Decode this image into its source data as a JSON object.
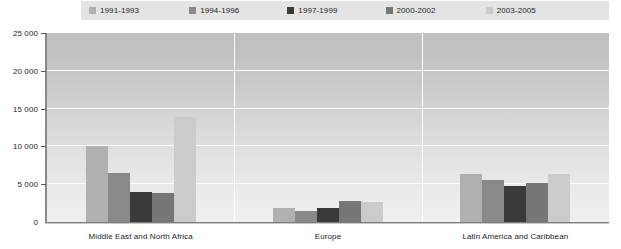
{
  "chart_data": {
    "type": "bar",
    "title": "",
    "subtitle": "",
    "xlabel": "",
    "ylabel": "",
    "categories": [
      "Middle East and North Africa",
      "Europe",
      "Latin America and Caribbean"
    ],
    "series": [
      {
        "name": "1991-1993",
        "color": "#b0b0b0",
        "values": [
          10100,
          1900,
          6400
        ]
      },
      {
        "name": "1994-1996",
        "color": "#898989",
        "values": [
          6500,
          1500,
          5500
        ]
      },
      {
        "name": "1997-1999",
        "color": "#3a3a3a",
        "values": [
          4000,
          1900,
          4800
        ]
      },
      {
        "name": "2000-2002",
        "color": "#767676",
        "values": [
          3800,
          2800,
          5200
        ]
      },
      {
        "name": "2003-2005",
        "color": "#cbcbcb",
        "values": [
          13900,
          2600,
          6300
        ]
      }
    ],
    "ylim": [
      0,
      25000
    ],
    "yticks": [
      0,
      5000,
      10000,
      15000,
      20000,
      25000
    ],
    "ytick_labels": [
      "0",
      "5 000",
      "10 000",
      "15 000",
      "20 000",
      "25 000"
    ],
    "grid": true,
    "legend_position": "top",
    "plot_background": "gradient-gray",
    "axis_color": "#7d7d7d",
    "gridline_color": "#fdfdfd"
  },
  "legend": {
    "background": "#e4e4e4",
    "items": [
      {
        "label": "1991-1993",
        "color": "#b0b0b0"
      },
      {
        "label": "1994-1996",
        "color": "#898989"
      },
      {
        "label": "1997-1999",
        "color": "#3a3a3a"
      },
      {
        "label": "2000-2002",
        "color": "#767676"
      },
      {
        "label": "2003-2005",
        "color": "#cbcbcb"
      }
    ]
  }
}
